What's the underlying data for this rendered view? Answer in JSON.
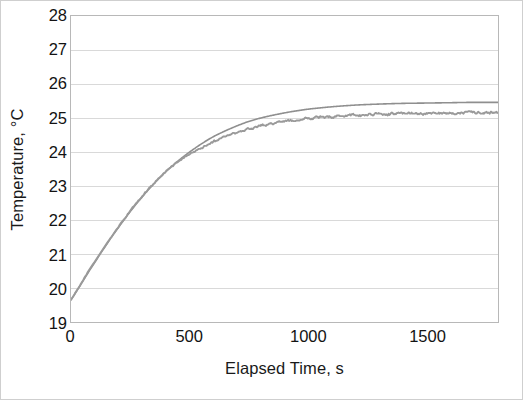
{
  "chart_data": {
    "type": "line",
    "title": "",
    "xlabel": "Elapsed Time, s",
    "ylabel": "Temperature, °C",
    "xlim": [
      0,
      1800
    ],
    "ylim": [
      19,
      28
    ],
    "xticks": [
      0,
      500,
      1000,
      1500
    ],
    "xtick_labels": [
      "0",
      "500",
      "1000",
      "1500"
    ],
    "yticks": [
      19,
      20,
      21,
      22,
      23,
      24,
      25,
      26,
      27,
      28
    ],
    "ytick_labels": [
      "19",
      "20",
      "21",
      "22",
      "23",
      "24",
      "25",
      "26",
      "27",
      "28"
    ],
    "grid": "horizontal",
    "legend": "none",
    "colors": {
      "model_line": "#8f8f8f",
      "measured_line": "#9a9a9a",
      "gridline": "#d9d9d9",
      "axis": "#b8b8b8",
      "text": "#131313",
      "background": "#ffffff"
    },
    "series": [
      {
        "name": "model",
        "style": "smooth",
        "x": [
          0,
          25,
          50,
          75,
          100,
          125,
          150,
          175,
          200,
          225,
          250,
          275,
          300,
          325,
          350,
          375,
          400,
          425,
          450,
          475,
          500,
          550,
          600,
          650,
          700,
          750,
          800,
          850,
          900,
          950,
          1000,
          1100,
          1200,
          1300,
          1400,
          1500,
          1600,
          1700,
          1800
        ],
        "values": [
          19.65,
          19.92,
          20.2,
          20.48,
          20.75,
          21.02,
          21.28,
          21.54,
          21.78,
          22.02,
          22.25,
          22.47,
          22.68,
          22.88,
          23.07,
          23.25,
          23.42,
          23.58,
          23.73,
          23.87,
          24.0,
          24.24,
          24.45,
          24.62,
          24.77,
          24.9,
          25.0,
          25.08,
          25.15,
          25.21,
          25.26,
          25.33,
          25.38,
          25.41,
          25.43,
          25.44,
          25.45,
          25.46,
          25.46
        ]
      },
      {
        "name": "measured",
        "style": "noisy",
        "x": [
          0,
          25,
          50,
          75,
          100,
          125,
          150,
          175,
          200,
          225,
          250,
          275,
          300,
          325,
          350,
          375,
          400,
          425,
          450,
          475,
          500,
          550,
          600,
          650,
          700,
          750,
          800,
          850,
          900,
          950,
          1000,
          1100,
          1200,
          1300,
          1400,
          1500,
          1600,
          1700,
          1800
        ],
        "values": [
          19.65,
          19.93,
          20.22,
          20.5,
          20.78,
          21.04,
          21.3,
          21.55,
          21.8,
          22.04,
          22.27,
          22.49,
          22.7,
          22.9,
          23.08,
          23.26,
          23.42,
          23.57,
          23.7,
          23.82,
          23.93,
          24.12,
          24.3,
          24.45,
          24.57,
          24.68,
          24.77,
          24.84,
          24.9,
          24.94,
          24.98,
          25.04,
          25.08,
          25.11,
          25.13,
          25.14,
          25.15,
          25.16,
          25.16
        ]
      }
    ],
    "annotations": []
  }
}
